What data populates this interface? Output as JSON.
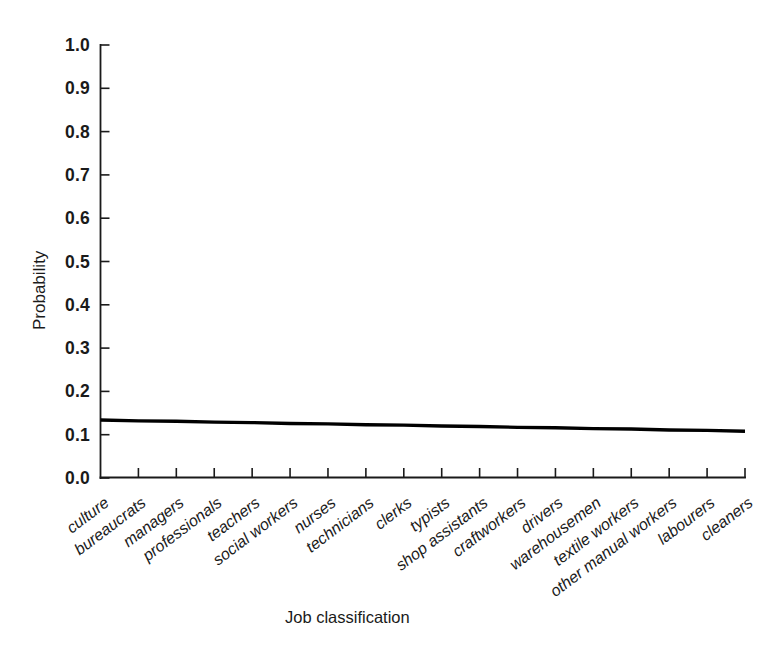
{
  "chart_data": {
    "type": "line",
    "title": "",
    "xlabel": "Job classification",
    "ylabel": "Probability",
    "ylim": [
      0.0,
      1.0
    ],
    "yticks": [
      "1.0",
      "0.9",
      "0.8",
      "0.7",
      "0.6",
      "0.5",
      "0.4",
      "0.3",
      "0.2",
      "0.1",
      "0.0"
    ],
    "ytick_values": [
      1.0,
      0.9,
      0.8,
      0.7,
      0.6,
      0.5,
      0.4,
      0.3,
      0.2,
      0.1,
      0.0
    ],
    "grid": false,
    "legend": "none",
    "categories": [
      "culture",
      "bureaucrats",
      "managers",
      "professionals",
      "teachers",
      "social workers",
      "nurses",
      "technicians",
      "clerks",
      "typists",
      "shop assistants",
      "craftworkers",
      "drivers",
      "warehousemen",
      "textile workers",
      "other manual workers",
      "labourers",
      "cleaners"
    ],
    "series": [
      {
        "name": "Probability",
        "values": [
          0.134,
          0.132,
          0.131,
          0.129,
          0.128,
          0.126,
          0.125,
          0.123,
          0.122,
          0.12,
          0.119,
          0.117,
          0.116,
          0.114,
          0.113,
          0.111,
          0.11,
          0.108
        ]
      }
    ],
    "line_color": "#000000",
    "axis_color": "#1a1a1a",
    "background_color": "#ffffff"
  }
}
